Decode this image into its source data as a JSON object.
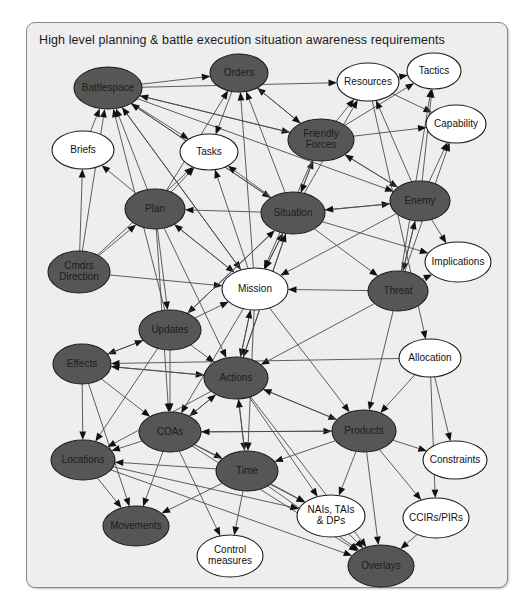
{
  "diagram": {
    "title": "High level planning & battle execution situation awareness requirements",
    "frame": {
      "x": 26,
      "y": 22,
      "width": 482,
      "height": 566
    },
    "colors": {
      "page_background": "#ffffff",
      "panel_background": "#eeeeee",
      "panel_border": "#8a8a8a",
      "node_dark_fill": "#565656",
      "node_light_fill": "#ffffff",
      "node_outline": "#1d1d1d",
      "edge_stroke": "#4c4c4c",
      "arrow_fill": "#111111",
      "title_text": "#1a1a1a"
    },
    "legend_note": "Dark-filled ellipses and white-filled ellipses denote two categories of situation awareness information elements."
  },
  "chart_data": {
    "type": "diagram",
    "graph_type": "directed-network",
    "title": "High level planning & battle execution situation awareness requirements",
    "node_count": 27,
    "edge_count": 118,
    "nodes": [
      {
        "id": "battlespace",
        "label": "Battlespace",
        "lines": [
          "Battlespace"
        ],
        "fill": "dark",
        "cx": 108,
        "cy": 88,
        "rx": 34,
        "ry": 21
      },
      {
        "id": "orders",
        "label": "Orders",
        "lines": [
          "Orders"
        ],
        "fill": "dark",
        "cx": 239,
        "cy": 73,
        "rx": 29,
        "ry": 19
      },
      {
        "id": "resources",
        "label": "Resources",
        "lines": [
          "Resources"
        ],
        "fill": "light",
        "cx": 368,
        "cy": 82,
        "rx": 31,
        "ry": 19
      },
      {
        "id": "tactics",
        "label": "Tactics",
        "lines": [
          "Tactics"
        ],
        "fill": "light",
        "cx": 434,
        "cy": 71,
        "rx": 27,
        "ry": 18
      },
      {
        "id": "capability",
        "label": "Capability",
        "lines": [
          "Capability"
        ],
        "fill": "light",
        "cx": 456,
        "cy": 124,
        "rx": 30,
        "ry": 19
      },
      {
        "id": "briefs",
        "label": "Briefs",
        "lines": [
          "Briefs"
        ],
        "fill": "light",
        "cx": 83,
        "cy": 150,
        "rx": 31,
        "ry": 19
      },
      {
        "id": "tasks",
        "label": "Tasks",
        "lines": [
          "Tasks"
        ],
        "fill": "light",
        "cx": 209,
        "cy": 152,
        "rx": 29,
        "ry": 18
      },
      {
        "id": "friendly_forces",
        "label": "Friendly Forces",
        "lines": [
          "Friendly",
          "Forces"
        ],
        "fill": "dark",
        "cx": 321,
        "cy": 140,
        "rx": 33,
        "ry": 21
      },
      {
        "id": "enemy",
        "label": "Enemy",
        "lines": [
          "Enemy"
        ],
        "fill": "dark",
        "cx": 420,
        "cy": 201,
        "rx": 30,
        "ry": 20
      },
      {
        "id": "plan",
        "label": "Plan",
        "lines": [
          "Plan"
        ],
        "fill": "dark",
        "cx": 155,
        "cy": 209,
        "rx": 30,
        "ry": 20
      },
      {
        "id": "situation",
        "label": "Situation",
        "lines": [
          "Situation"
        ],
        "fill": "dark",
        "cx": 293,
        "cy": 213,
        "rx": 32,
        "ry": 21
      },
      {
        "id": "implications",
        "label": "Implications",
        "lines": [
          "Implications"
        ],
        "fill": "light",
        "cx": 458,
        "cy": 262,
        "rx": 33,
        "ry": 20
      },
      {
        "id": "cmdrs_direction",
        "label": "Cmdrs Direction",
        "lines": [
          "Cmdrs",
          "Direction"
        ],
        "fill": "dark",
        "cx": 79,
        "cy": 272,
        "rx": 31,
        "ry": 21
      },
      {
        "id": "mission",
        "label": "Mission",
        "lines": [
          "Mission"
        ],
        "fill": "light",
        "cx": 255,
        "cy": 289,
        "rx": 33,
        "ry": 21
      },
      {
        "id": "threat",
        "label": "Threat",
        "lines": [
          "Threat"
        ],
        "fill": "dark",
        "cx": 398,
        "cy": 291,
        "rx": 30,
        "ry": 20
      },
      {
        "id": "updates",
        "label": "Updates",
        "lines": [
          "Updates"
        ],
        "fill": "dark",
        "cx": 170,
        "cy": 330,
        "rx": 31,
        "ry": 20
      },
      {
        "id": "effects",
        "label": "Effects",
        "lines": [
          "Effects"
        ],
        "fill": "dark",
        "cx": 82,
        "cy": 364,
        "rx": 29,
        "ry": 20
      },
      {
        "id": "actions",
        "label": "Actions",
        "lines": [
          "Actions"
        ],
        "fill": "dark",
        "cx": 236,
        "cy": 378,
        "rx": 32,
        "ry": 21
      },
      {
        "id": "allocation",
        "label": "Allocation",
        "lines": [
          "Allocation"
        ],
        "fill": "light",
        "cx": 430,
        "cy": 358,
        "rx": 31,
        "ry": 19
      },
      {
        "id": "coas",
        "label": "COAs",
        "lines": [
          "COAs"
        ],
        "fill": "dark",
        "cx": 170,
        "cy": 432,
        "rx": 31,
        "ry": 20
      },
      {
        "id": "products",
        "label": "Products",
        "lines": [
          "Products"
        ],
        "fill": "dark",
        "cx": 364,
        "cy": 431,
        "rx": 32,
        "ry": 21
      },
      {
        "id": "constraints",
        "label": "Constraints",
        "lines": [
          "Constraints"
        ],
        "fill": "light",
        "cx": 455,
        "cy": 460,
        "rx": 32,
        "ry": 19
      },
      {
        "id": "locations",
        "label": "Locations",
        "lines": [
          "Locations"
        ],
        "fill": "dark",
        "cx": 83,
        "cy": 460,
        "rx": 32,
        "ry": 20
      },
      {
        "id": "time",
        "label": "Time",
        "lines": [
          "Time"
        ],
        "fill": "dark",
        "cx": 247,
        "cy": 471,
        "rx": 31,
        "ry": 20
      },
      {
        "id": "nais_tais_dps",
        "label": "NAIs, TAIs & DPs",
        "lines": [
          "NAIs, TAIs",
          "& DPs"
        ],
        "fill": "light",
        "cx": 331,
        "cy": 516,
        "rx": 34,
        "ry": 21
      },
      {
        "id": "ccirs_pirs",
        "label": "CCIRs/PIRs",
        "lines": [
          "CCIRs/PIRs"
        ],
        "fill": "light",
        "cx": 436,
        "cy": 518,
        "rx": 33,
        "ry": 20
      },
      {
        "id": "movements",
        "label": "Movements",
        "lines": [
          "Movements"
        ],
        "fill": "dark",
        "cx": 136,
        "cy": 526,
        "rx": 33,
        "ry": 20
      },
      {
        "id": "control_measures",
        "label": "Control measures",
        "lines": [
          "Control",
          "measures"
        ],
        "fill": "light",
        "cx": 230,
        "cy": 556,
        "rx": 33,
        "ry": 21
      },
      {
        "id": "overlays",
        "label": "Overlays",
        "lines": [
          "Overlays"
        ],
        "fill": "dark",
        "cx": 381,
        "cy": 566,
        "rx": 33,
        "ry": 21
      }
    ],
    "edges": [
      {
        "from": "battlespace",
        "to": "orders"
      },
      {
        "from": "battlespace",
        "to": "resources"
      },
      {
        "from": "battlespace",
        "to": "tasks"
      },
      {
        "from": "battlespace",
        "to": "friendly_forces"
      },
      {
        "from": "battlespace",
        "to": "situation"
      },
      {
        "from": "battlespace",
        "to": "enemy"
      },
      {
        "from": "battlespace",
        "to": "mission"
      },
      {
        "from": "briefs",
        "to": "battlespace"
      },
      {
        "from": "plan",
        "to": "battlespace"
      },
      {
        "from": "plan",
        "to": "briefs"
      },
      {
        "from": "plan",
        "to": "orders"
      },
      {
        "from": "plan",
        "to": "tasks"
      },
      {
        "from": "plan",
        "to": "mission"
      },
      {
        "from": "plan",
        "to": "updates"
      },
      {
        "from": "plan",
        "to": "actions"
      },
      {
        "from": "plan",
        "to": "coas"
      },
      {
        "from": "cmdrs_direction",
        "to": "battlespace"
      },
      {
        "from": "cmdrs_direction",
        "to": "plan"
      },
      {
        "from": "cmdrs_direction",
        "to": "mission"
      },
      {
        "from": "cmdrs_direction",
        "to": "briefs"
      },
      {
        "from": "cmdrs_direction",
        "to": "tasks"
      },
      {
        "from": "mission",
        "to": "battlespace"
      },
      {
        "from": "mission",
        "to": "orders"
      },
      {
        "from": "mission",
        "to": "tasks"
      },
      {
        "from": "mission",
        "to": "plan"
      },
      {
        "from": "mission",
        "to": "actions"
      },
      {
        "from": "mission",
        "to": "coas"
      },
      {
        "from": "mission",
        "to": "time"
      },
      {
        "from": "mission",
        "to": "products"
      },
      {
        "from": "mission",
        "to": "situation"
      },
      {
        "from": "situation",
        "to": "battlespace"
      },
      {
        "from": "situation",
        "to": "orders"
      },
      {
        "from": "situation",
        "to": "tasks"
      },
      {
        "from": "situation",
        "to": "friendly_forces"
      },
      {
        "from": "situation",
        "to": "enemy"
      },
      {
        "from": "situation",
        "to": "mission"
      },
      {
        "from": "situation",
        "to": "threat"
      },
      {
        "from": "situation",
        "to": "updates"
      },
      {
        "from": "situation",
        "to": "actions"
      },
      {
        "from": "situation",
        "to": "plan"
      },
      {
        "from": "situation",
        "to": "resources"
      },
      {
        "from": "situation",
        "to": "implications"
      },
      {
        "from": "friendly_forces",
        "to": "resources"
      },
      {
        "from": "friendly_forces",
        "to": "tactics"
      },
      {
        "from": "friendly_forces",
        "to": "capability"
      },
      {
        "from": "friendly_forces",
        "to": "orders"
      },
      {
        "from": "friendly_forces",
        "to": "situation"
      },
      {
        "from": "friendly_forces",
        "to": "enemy"
      },
      {
        "from": "friendly_forces",
        "to": "mission"
      },
      {
        "from": "friendly_forces",
        "to": "battlespace"
      },
      {
        "from": "resources",
        "to": "tactics"
      },
      {
        "from": "resources",
        "to": "capability"
      },
      {
        "from": "resources",
        "to": "allocation"
      },
      {
        "from": "enemy",
        "to": "tactics"
      },
      {
        "from": "enemy",
        "to": "capability"
      },
      {
        "from": "enemy",
        "to": "implications"
      },
      {
        "from": "enemy",
        "to": "threat"
      },
      {
        "from": "enemy",
        "to": "situation"
      },
      {
        "from": "enemy",
        "to": "mission"
      },
      {
        "from": "enemy",
        "to": "friendly_forces"
      },
      {
        "from": "enemy",
        "to": "resources"
      },
      {
        "from": "threat",
        "to": "implications"
      },
      {
        "from": "threat",
        "to": "mission"
      },
      {
        "from": "threat",
        "to": "enemy"
      },
      {
        "from": "threat",
        "to": "actions"
      },
      {
        "from": "threat",
        "to": "tactics"
      },
      {
        "from": "threat",
        "to": "capability"
      },
      {
        "from": "threat",
        "to": "products"
      },
      {
        "from": "updates",
        "to": "battlespace"
      },
      {
        "from": "updates",
        "to": "situation"
      },
      {
        "from": "updates",
        "to": "effects"
      },
      {
        "from": "updates",
        "to": "actions"
      },
      {
        "from": "updates",
        "to": "locations"
      },
      {
        "from": "updates",
        "to": "coas"
      },
      {
        "from": "updates",
        "to": "mission"
      },
      {
        "from": "effects",
        "to": "locations"
      },
      {
        "from": "effects",
        "to": "actions"
      },
      {
        "from": "effects",
        "to": "coas"
      },
      {
        "from": "effects",
        "to": "movements"
      },
      {
        "from": "effects",
        "to": "updates"
      },
      {
        "from": "actions",
        "to": "effects"
      },
      {
        "from": "actions",
        "to": "locations"
      },
      {
        "from": "actions",
        "to": "time"
      },
      {
        "from": "actions",
        "to": "coas"
      },
      {
        "from": "actions",
        "to": "products"
      },
      {
        "from": "actions",
        "to": "nais_tais_dps"
      },
      {
        "from": "actions",
        "to": "overlays"
      },
      {
        "from": "actions",
        "to": "mission"
      },
      {
        "from": "actions",
        "to": "situation"
      },
      {
        "from": "coas",
        "to": "locations"
      },
      {
        "from": "coas",
        "to": "time"
      },
      {
        "from": "coas",
        "to": "actions"
      },
      {
        "from": "coas",
        "to": "movements"
      },
      {
        "from": "coas",
        "to": "products"
      },
      {
        "from": "coas",
        "to": "nais_tais_dps"
      },
      {
        "from": "coas",
        "to": "overlays"
      },
      {
        "from": "coas",
        "to": "control_measures"
      },
      {
        "from": "time",
        "to": "locations"
      },
      {
        "from": "time",
        "to": "nais_tais_dps"
      },
      {
        "from": "time",
        "to": "control_measures"
      },
      {
        "from": "time",
        "to": "overlays"
      },
      {
        "from": "time",
        "to": "actions"
      },
      {
        "from": "time",
        "to": "movements"
      },
      {
        "from": "locations",
        "to": "movements"
      },
      {
        "from": "locations",
        "to": "overlays"
      },
      {
        "from": "locations",
        "to": "nais_tais_dps"
      },
      {
        "from": "products",
        "to": "overlays"
      },
      {
        "from": "products",
        "to": "nais_tais_dps"
      },
      {
        "from": "products",
        "to": "ccirs_pirs"
      },
      {
        "from": "products",
        "to": "constraints"
      },
      {
        "from": "products",
        "to": "actions"
      },
      {
        "from": "products",
        "to": "time"
      },
      {
        "from": "products",
        "to": "coas"
      },
      {
        "from": "allocation",
        "to": "constraints"
      },
      {
        "from": "allocation",
        "to": "products"
      },
      {
        "from": "allocation",
        "to": "ccirs_pirs"
      },
      {
        "from": "allocation",
        "to": "effects"
      },
      {
        "from": "nais_tais_dps",
        "to": "overlays"
      },
      {
        "from": "ccirs_pirs",
        "to": "overlays"
      },
      {
        "from": "orders",
        "to": "tasks"
      },
      {
        "from": "orders",
        "to": "friendly_forces"
      }
    ]
  }
}
